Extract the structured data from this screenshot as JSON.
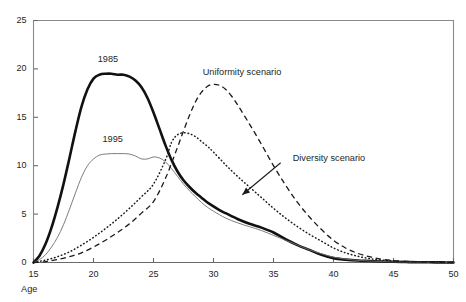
{
  "chart_data": {
    "type": "line",
    "title": "",
    "xlabel": "Age",
    "ylabel": "",
    "xlim": [
      15,
      50
    ],
    "ylim": [
      0,
      25
    ],
    "grid": false,
    "legend_position": "inline-annotations",
    "xticks": [
      "15",
      "20",
      "25",
      "30",
      "35",
      "40",
      "45",
      "50"
    ],
    "yticks": [
      "0",
      "5",
      "10",
      "15",
      "20",
      "25"
    ],
    "annotations": [
      {
        "name": "1985",
        "text": "1985",
        "x": 21.2,
        "y": 20.9
      },
      {
        "name": "1995",
        "text": "1995",
        "x": 21.6,
        "y": 12.7
      },
      {
        "name": "uniformity",
        "text": "Uniformity scenario",
        "x": 29.1,
        "y": 19.6
      },
      {
        "name": "diversity",
        "text": "Diversity scenario",
        "x": 36.6,
        "y": 10.7
      }
    ],
    "series": [
      {
        "name": "1985",
        "style": "solid-thick",
        "color": "#111111",
        "x": [
          15,
          15.5,
          16,
          16.5,
          17,
          17.5,
          18,
          18.5,
          19,
          19.5,
          20,
          20.5,
          21,
          21.5,
          22,
          22.5,
          23,
          23.5,
          24,
          24.5,
          25,
          25.5,
          26,
          26.5,
          27,
          27.5,
          28,
          28.5,
          29,
          29.5,
          30,
          30.5,
          31,
          32,
          33,
          34,
          35,
          36,
          37,
          38,
          39,
          40,
          41,
          42,
          43,
          44,
          45,
          46,
          47,
          48,
          49,
          50
        ],
        "y": [
          0,
          0.7,
          1.9,
          3.6,
          5.7,
          8.1,
          10.8,
          13.6,
          16.1,
          17.9,
          19.0,
          19.4,
          19.5,
          19.5,
          19.4,
          19.4,
          19.2,
          18.8,
          18.1,
          17.0,
          15.5,
          13.8,
          12.1,
          10.6,
          9.4,
          8.5,
          7.8,
          7.2,
          6.7,
          6.2,
          5.8,
          5.4,
          5.1,
          4.5,
          4.0,
          3.6,
          3.1,
          2.4,
          1.8,
          1.3,
          0.8,
          0.45,
          0.3,
          0.2,
          0.15,
          0.1,
          0.07,
          0.05,
          0.03,
          0.02,
          0.01,
          0
        ]
      },
      {
        "name": "1995",
        "style": "solid-thin",
        "color": "#6e6e6e",
        "x": [
          15,
          15.5,
          16,
          16.5,
          17,
          17.5,
          18,
          18.5,
          19,
          19.5,
          20,
          20.5,
          21,
          21.5,
          22,
          22.5,
          23,
          23.5,
          24,
          24.5,
          25,
          25.5,
          26,
          26.5,
          27,
          27.5,
          28,
          28.5,
          29,
          29.5,
          30,
          31,
          32,
          33,
          34,
          35,
          36,
          37,
          38,
          39,
          40,
          41,
          42,
          43,
          44,
          45,
          46,
          47,
          48,
          49,
          50
        ],
        "y": [
          0,
          0.3,
          0.8,
          1.6,
          2.6,
          3.9,
          5.5,
          7.2,
          8.8,
          10.0,
          10.7,
          11.1,
          11.2,
          11.25,
          11.25,
          11.25,
          11.2,
          11.0,
          10.7,
          10.7,
          10.9,
          10.8,
          10.4,
          9.7,
          8.9,
          8.1,
          7.4,
          6.8,
          6.2,
          5.7,
          5.3,
          4.6,
          4.1,
          3.7,
          3.3,
          2.8,
          2.3,
          1.8,
          1.3,
          0.9,
          0.55,
          0.35,
          0.22,
          0.15,
          0.1,
          0.07,
          0.05,
          0.03,
          0.02,
          0.01,
          0
        ]
      },
      {
        "name": "Diversity scenario",
        "style": "dotted",
        "color": "#1a1a1a",
        "x": [
          15,
          16,
          17,
          18,
          19,
          20,
          21,
          22,
          23,
          24,
          25,
          26,
          26.5,
          27,
          27.5,
          28,
          28.5,
          29,
          29.5,
          30,
          31,
          32,
          33,
          34,
          35,
          36,
          37,
          38,
          39,
          40,
          41,
          42,
          43,
          44,
          45,
          46,
          47,
          48,
          49,
          50
        ],
        "y": [
          0,
          0.25,
          0.6,
          1.1,
          1.8,
          2.6,
          3.5,
          4.5,
          5.6,
          6.8,
          8.1,
          10.6,
          12.4,
          13.2,
          13.4,
          13.3,
          13.0,
          12.5,
          12.0,
          11.4,
          10.1,
          8.9,
          7.8,
          6.7,
          5.6,
          4.6,
          3.7,
          2.9,
          2.2,
          1.5,
          1.0,
          0.65,
          0.4,
          0.25,
          0.15,
          0.1,
          0.06,
          0.04,
          0.02,
          0
        ]
      },
      {
        "name": "Uniformity scenario",
        "style": "dashed",
        "color": "#1a1a1a",
        "x": [
          15,
          16,
          17,
          18,
          19,
          20,
          21,
          22,
          23,
          24,
          25,
          26,
          27,
          27.5,
          28,
          28.5,
          29,
          29.5,
          30,
          30.5,
          31,
          31.5,
          32,
          33,
          34,
          35,
          36,
          37,
          38,
          39,
          40,
          41,
          42,
          43,
          44,
          45,
          46,
          47,
          48,
          49,
          50
        ],
        "y": [
          0,
          0.1,
          0.3,
          0.6,
          1.0,
          1.6,
          2.3,
          3.1,
          4.0,
          5.1,
          6.3,
          8.7,
          11.9,
          13.6,
          15.2,
          16.6,
          17.6,
          18.2,
          18.4,
          18.3,
          17.9,
          17.2,
          16.3,
          14.3,
          12.2,
          10.0,
          8.0,
          6.2,
          4.7,
          3.4,
          2.3,
          1.5,
          0.95,
          0.6,
          0.35,
          0.2,
          0.12,
          0.07,
          0.03,
          0.01,
          0
        ]
      }
    ]
  }
}
